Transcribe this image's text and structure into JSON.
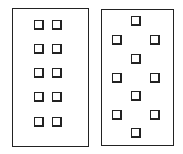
{
  "figure": {
    "panels": [
      {
        "id": "left",
        "layout": "grid-2x5",
        "box": {
          "x": 12,
          "y": 8,
          "w": 77,
          "h": 139
        },
        "squares": [
          {
            "x": 34,
            "y": 20
          },
          {
            "x": 52,
            "y": 20
          },
          {
            "x": 34,
            "y": 44
          },
          {
            "x": 52,
            "y": 44
          },
          {
            "x": 34,
            "y": 68
          },
          {
            "x": 52,
            "y": 68
          },
          {
            "x": 34,
            "y": 92
          },
          {
            "x": 52,
            "y": 92
          },
          {
            "x": 34,
            "y": 117
          },
          {
            "x": 52,
            "y": 117
          }
        ]
      },
      {
        "id": "right",
        "layout": "staggered",
        "box": {
          "x": 101,
          "y": 9,
          "w": 73,
          "h": 137
        },
        "squares": [
          {
            "x": 131,
            "y": 16
          },
          {
            "x": 112,
            "y": 35
          },
          {
            "x": 150,
            "y": 35
          },
          {
            "x": 131,
            "y": 54
          },
          {
            "x": 112,
            "y": 73
          },
          {
            "x": 150,
            "y": 73
          },
          {
            "x": 131,
            "y": 91
          },
          {
            "x": 112,
            "y": 110
          },
          {
            "x": 150,
            "y": 110
          },
          {
            "x": 131,
            "y": 128
          }
        ]
      }
    ],
    "square_count_each": 10,
    "colors": {
      "stroke": "#222222",
      "fill": "#ffffff"
    }
  }
}
